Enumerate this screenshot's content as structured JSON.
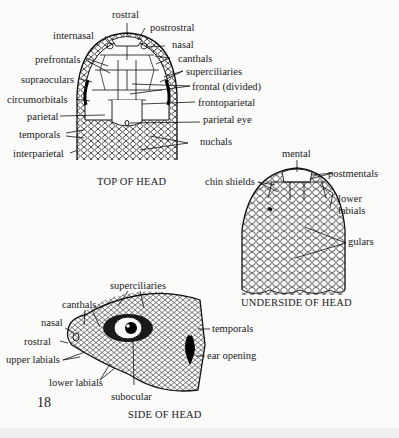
{
  "page": {
    "number": "18",
    "background": "#fbfbfa"
  },
  "figures": {
    "top": {
      "caption": "TOP OF HEAD",
      "labels": {
        "rostral": "rostral",
        "postrostral": "postrostral",
        "internasal": "internasal",
        "nasal": "nasal",
        "canthals": "canthals",
        "prefrontals": "prefrontals",
        "superciliaries": "superciliaries",
        "supraoculars": "supraoculars",
        "frontal": "frontal (divided)",
        "circumorbitals": "circumorbitals",
        "frontoparietal": "frontoparietal",
        "parietal": "parietal",
        "parietal_eye": "parietal eye",
        "temporals": "temporals",
        "nuchals": "nuchals",
        "interparietal": "interparietal"
      }
    },
    "under": {
      "caption": "UNDERSIDE OF HEAD",
      "labels": {
        "mental": "mental",
        "postmentals": "postmentals",
        "chin_shields": "chin shields",
        "lower_labials_1": "lower",
        "lower_labials_2": "labials",
        "gulars": "gulars"
      }
    },
    "side": {
      "caption": "SIDE OF HEAD",
      "labels": {
        "superciliaries": "superciliaries",
        "canthals": "canthals",
        "nasal": "nasal",
        "rostral": "rostral",
        "temporals": "temporals",
        "upper_labials": "upper labials",
        "ear_opening": "ear opening",
        "lower_labials": "lower labials",
        "subocular": "subocular"
      }
    }
  }
}
